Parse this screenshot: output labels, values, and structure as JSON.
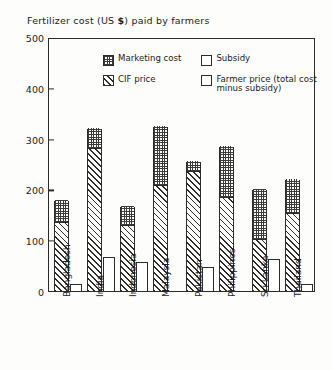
{
  "chart_data": {
    "type": "bar",
    "title": "Fertilizer cost  (US $) paid by farmers",
    "xlabel": "",
    "ylabel": "",
    "ylim": [
      0,
      500
    ],
    "yticks": [
      0,
      100,
      200,
      300,
      400,
      500
    ],
    "grid": false,
    "legend_position": "inside-top-center",
    "categories": [
      "Bangladesh",
      "India",
      "Indonesia",
      "Malaysia",
      "Pakistan",
      "Philippines",
      "Sri Lanka",
      "Thailand"
    ],
    "series": [
      {
        "name": "CIF price",
        "pattern": "diagonal-hatch",
        "values": [
          134,
          280,
          127,
          207,
          235,
          183,
          100,
          152
        ]
      },
      {
        "name": "Marketing cost",
        "pattern": "checker-dots",
        "values": [
          46,
          40,
          41,
          118,
          20,
          102,
          100,
          68
        ]
      },
      {
        "name": "Subsidy",
        "pattern": "blank",
        "values": [
          165,
          252,
          108,
          325,
          205,
          285,
          135,
          205
        ]
      },
      {
        "name": "Farmer price (total cost minus subsidy)",
        "pattern": "blank",
        "values": [
          15,
          68,
          60,
          0,
          50,
          0,
          65,
          15
        ]
      }
    ],
    "totals": [
      180,
      320,
      168,
      325,
      255,
      285,
      200,
      220
    ]
  },
  "title": {
    "prefix": "Fertilizer cost  (US ",
    "currency": "$",
    "suffix": ") paid by farmers"
  },
  "yaxis": {
    "ticks": [
      "500",
      "400",
      "300",
      "200",
      "100",
      "0"
    ]
  },
  "legend": {
    "items": [
      {
        "label": "Marketing cost",
        "swatch": "checker-dots"
      },
      {
        "label": "Subsidy",
        "swatch": "blank"
      },
      {
        "label": "CIF price",
        "swatch": "diagonal-hatch"
      },
      {
        "label": "Farmer price (total cost minus subsidy)",
        "swatch": "blank"
      }
    ]
  }
}
